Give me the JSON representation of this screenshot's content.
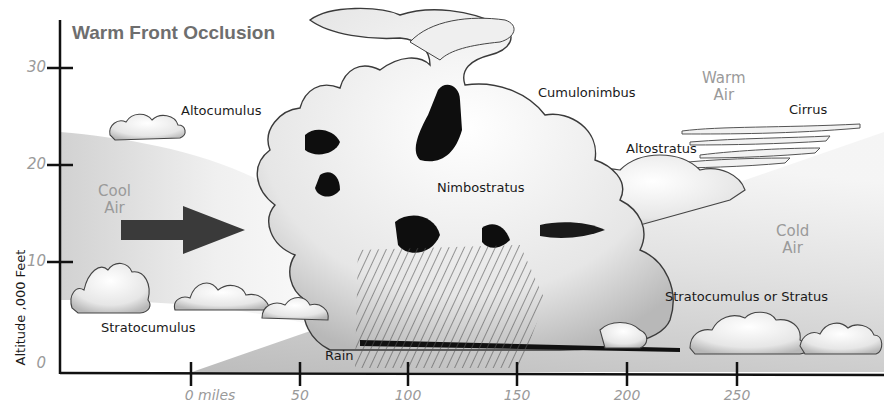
{
  "diagram": {
    "title": "Warm Front Occlusion",
    "y_axis": {
      "label": "Altitude ,000 Feet",
      "ticks": [
        "30",
        "20",
        "10",
        "0"
      ]
    },
    "x_axis": {
      "ticks": [
        "0 miles",
        "50",
        "100",
        "150",
        "200",
        "250"
      ]
    },
    "air_masses": {
      "cool": "Cool\nAir",
      "warm": "Warm\nAir",
      "cold": "Cold\nAir"
    },
    "clouds": {
      "altocumulus": "Altocumulus",
      "cumulonimbus": "Cumulonimbus",
      "cirrus": "Cirrus",
      "altostratus": "Altostratus",
      "nimbostratus": "Nimbostratus",
      "stratocumulus": "Stratocumulus",
      "stratocumulus_or_stratus": "Stratocumulus or Stratus"
    },
    "precipitation": "Rain",
    "arrow": "right-arrow",
    "colors": {
      "title": "#6e6e6e",
      "tick_labels": "#9a9a9a",
      "axis": "#111111",
      "arrow": "#3a3a3a",
      "cloud_fill": "#f2f2f2",
      "cloud_shadow": "#111111",
      "wedge": "#c8c8c8"
    }
  }
}
